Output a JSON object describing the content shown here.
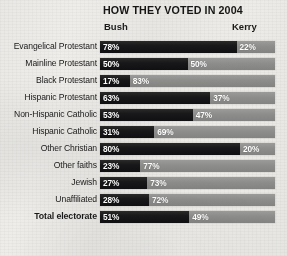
{
  "chart_data": {
    "type": "bar",
    "title": "HOW THEY VOTED IN 2004",
    "subtype": "stacked-horizontal-100pct",
    "xlabel": "",
    "ylabel": "",
    "xlim": [
      0,
      100
    ],
    "grid": false,
    "legend_position": "top",
    "categories": [
      "Evangelical Protestant",
      "Mainline Protestant",
      "Black Protestant",
      "Hispanic Protestant",
      "Non-Hispanic Catholic",
      "Hispanic Catholic",
      "Other Christian",
      "Other faiths",
      "Jewish",
      "Unaffiliated",
      "Total electorate"
    ],
    "series": [
      {
        "name": "Bush",
        "color": "#16161a",
        "values": [
          78,
          50,
          17,
          63,
          53,
          31,
          80,
          23,
          27,
          28,
          51
        ],
        "labels": [
          "78%",
          "50%",
          "17%",
          "63%",
          "53%",
          "31%",
          "80%",
          "23%",
          "27%",
          "28%",
          "51%"
        ]
      },
      {
        "name": "Kerry",
        "color": "#8d8d8b",
        "values": [
          22,
          50,
          83,
          37,
          47,
          69,
          20,
          77,
          73,
          72,
          49
        ],
        "labels": [
          "22%",
          "50%",
          "83%",
          "37%",
          "47%",
          "69%",
          "20%",
          "77%",
          "73%",
          "72%",
          "49%"
        ]
      }
    ],
    "emphasized_row": "Total electorate"
  },
  "header": {
    "bush_label": "Bush",
    "kerry_label": "Kerry"
  }
}
